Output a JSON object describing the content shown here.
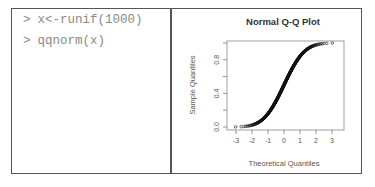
{
  "console": {
    "prompt": ">",
    "lines": [
      {
        "prompt": ">",
        "code": "x<-runif(1000)"
      },
      {
        "prompt": ">",
        "code": "qqnorm(x)"
      }
    ]
  },
  "plot": {
    "title": "Normal Q-Q Plot",
    "xlabel": "Theoretical Quantiles",
    "ylabel": "Sample Quantiles",
    "xticks": [
      "-3",
      "-2",
      "-1",
      "0",
      "1",
      "2",
      "3"
    ],
    "yticks": [
      "0.0",
      "0.4",
      "0.8"
    ]
  },
  "chart_data": {
    "type": "scatter",
    "title": "Normal Q-Q Plot",
    "xlabel": "Theoretical Quantiles",
    "ylabel": "Sample Quantiles",
    "x_ticks": [
      -3,
      -2,
      -1,
      0,
      1,
      2,
      3
    ],
    "y_ticks": [
      0.0,
      0.2,
      0.4,
      0.6,
      0.8,
      1.0
    ],
    "y_tick_labels": [
      "0.0",
      "0.4",
      "0.8"
    ],
    "xlim": [
      -3.3,
      3.3
    ],
    "ylim": [
      -0.02,
      1.02
    ],
    "grid": false,
    "legend": null,
    "series": [
      {
        "name": "qqnorm(runif(1000))",
        "marker": "open-circle",
        "points": [
          [
            -3.2,
            0.001
          ],
          [
            -2.9,
            0.002
          ],
          [
            -2.6,
            0.004
          ],
          [
            -2.3,
            0.01
          ],
          [
            -2.0,
            0.023
          ],
          [
            -1.7,
            0.045
          ],
          [
            -1.4,
            0.08
          ],
          [
            -1.1,
            0.135
          ],
          [
            -0.8,
            0.21
          ],
          [
            -0.5,
            0.31
          ],
          [
            -0.25,
            0.4
          ],
          [
            0.0,
            0.5
          ],
          [
            0.25,
            0.6
          ],
          [
            0.5,
            0.69
          ],
          [
            0.8,
            0.79
          ],
          [
            1.1,
            0.865
          ],
          [
            1.4,
            0.92
          ],
          [
            1.7,
            0.955
          ],
          [
            2.0,
            0.977
          ],
          [
            2.3,
            0.99
          ],
          [
            2.6,
            0.996
          ],
          [
            2.9,
            0.998
          ],
          [
            3.2,
            0.999
          ]
        ]
      }
    ]
  }
}
